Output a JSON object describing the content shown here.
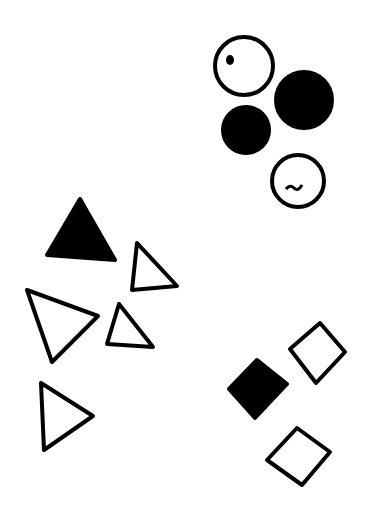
{
  "diagram": {
    "width": 380,
    "height": 513,
    "background": "#ffffff",
    "ink": "#000000",
    "stroke_width": 4,
    "groups": [
      {
        "name": "circles",
        "shapes": [
          {
            "type": "circle",
            "filled": false,
            "cx": 244,
            "cy": 66,
            "r": 29,
            "mark": "dot"
          },
          {
            "type": "circle",
            "filled": true,
            "cx": 304,
            "cy": 100,
            "r": 28
          },
          {
            "type": "circle",
            "filled": true,
            "cx": 246,
            "cy": 130,
            "r": 23
          },
          {
            "type": "circle",
            "filled": false,
            "cx": 298,
            "cy": 181,
            "r": 26,
            "mark": "squiggle"
          }
        ]
      },
      {
        "name": "triangles",
        "shapes": [
          {
            "type": "triangle",
            "filled": true,
            "points": "47,255 80,199 115,260"
          },
          {
            "type": "triangle",
            "filled": false,
            "points": "132,290 137,243 177,286"
          },
          {
            "type": "triangle",
            "filled": false,
            "points": "27,290 98,316 52,362"
          },
          {
            "type": "triangle",
            "filled": false,
            "points": "107,344 119,304 153,347"
          },
          {
            "type": "triangle",
            "filled": false,
            "points": "41,383 93,416 44,450"
          }
        ]
      },
      {
        "name": "squares",
        "shapes": [
          {
            "type": "diamond",
            "filled": true,
            "points": "229,389 257,360 287,384 255,418"
          },
          {
            "type": "diamond",
            "filled": false,
            "points": "290,349 320,323 345,352 316,383"
          },
          {
            "type": "diamond",
            "filled": false,
            "points": "267,460 297,428 330,452 302,485"
          }
        ]
      }
    ]
  }
}
